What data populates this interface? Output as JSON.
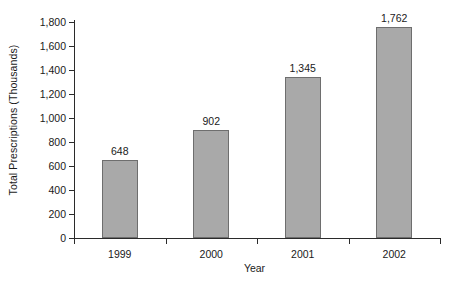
{
  "chart_data": {
    "type": "bar",
    "title": "",
    "xlabel": "Year",
    "ylabel": "Total Prescriptions (Thousands)",
    "categories": [
      "1999",
      "2000",
      "2001",
      "2002"
    ],
    "values": [
      648,
      902,
      1345,
      1762
    ],
    "value_labels": [
      "648",
      "902",
      "1,345",
      "1,762"
    ],
    "ylim": [
      0,
      1800
    ],
    "y_ticks": [
      0,
      200,
      400,
      600,
      800,
      1000,
      1200,
      1400,
      1600,
      1800
    ],
    "y_tick_labels": [
      "0",
      "200",
      "400",
      "600",
      "800",
      "1,000",
      "1,200",
      "1,400",
      "1,600",
      "1,800"
    ],
    "grid": false,
    "legend": false,
    "bar_color": "#a9a9a9",
    "bar_edge_color": "#6e6e6e",
    "axis_color": "#2b2b2b",
    "background": "#ffffff"
  }
}
